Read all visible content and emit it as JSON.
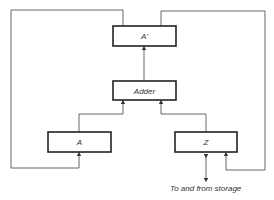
{
  "diagram": {
    "nodes": [
      {
        "id": "a_prime",
        "label": "A'"
      },
      {
        "id": "adder",
        "label": "Adder"
      },
      {
        "id": "a",
        "label": "A"
      },
      {
        "id": "z",
        "label": "Z"
      }
    ],
    "edges": [
      {
        "from": "adder",
        "to": "a_prime"
      },
      {
        "from": "a",
        "to": "adder"
      },
      {
        "from": "z",
        "to": "adder"
      },
      {
        "from": "a_prime",
        "to": "a",
        "route": "left loop"
      },
      {
        "from": "a_prime",
        "to": "z",
        "route": "right loop"
      },
      {
        "from": "z",
        "to": "storage",
        "bidirectional": true
      }
    ],
    "caption": "To and from storage"
  }
}
